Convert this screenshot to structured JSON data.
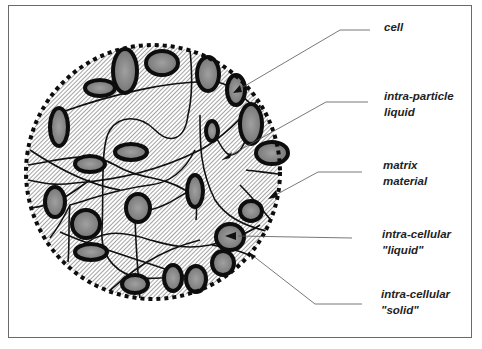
{
  "diagram": {
    "type": "particle-cross-section",
    "colors": {
      "background": "#ffffff",
      "frame": "#6a6a6a",
      "outline": "#111111",
      "hatch": "#555555",
      "cell_fill": "#8a8a8a",
      "leader": "#555555"
    },
    "labels": [
      {
        "id": "cell",
        "lines": [
          "cell"
        ]
      },
      {
        "id": "intra-particle-liquid",
        "lines": [
          "intra-particle",
          "liquid"
        ]
      },
      {
        "id": "matrix-material",
        "lines": [
          "matrix",
          "material"
        ]
      },
      {
        "id": "intra-cellular-liquid",
        "lines": [
          "intra-cellular",
          "\"liquid\""
        ]
      },
      {
        "id": "intra-cellular-solid",
        "lines": [
          "intra-cellular",
          "\"solid\""
        ]
      }
    ]
  }
}
